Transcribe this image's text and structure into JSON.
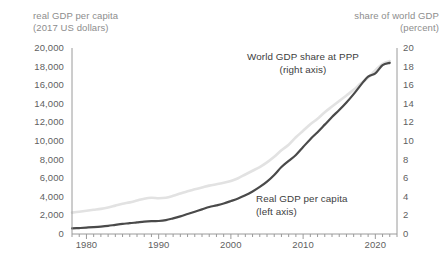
{
  "chart_data": {
    "type": "line",
    "title": "",
    "subtitle": "",
    "xlabel": "",
    "ylabel": "real GDP per capita (2017 US dollars)",
    "y2label": "share of world GDP (percent)",
    "grid": false,
    "legend_position": "inline-annotations",
    "xlim": [
      1978,
      2023
    ],
    "ylim": [
      0,
      20000
    ],
    "y2lim": [
      0,
      20
    ],
    "x_ticks": [
      1980,
      1990,
      2000,
      2010,
      2020
    ],
    "x_minor_tick_interval": 1,
    "y_left_ticks": [
      0,
      2000,
      4000,
      6000,
      8000,
      10000,
      12000,
      14000,
      16000,
      18000,
      20000
    ],
    "y_left_tick_labels": [
      "0",
      "2,000",
      "4,000",
      "6,000",
      "8,000",
      "10,000",
      "12,000",
      "14,000",
      "16,000",
      "18,000",
      "20,000"
    ],
    "y_right_ticks": [
      0,
      2,
      4,
      6,
      8,
      10,
      12,
      14,
      16,
      18,
      20
    ],
    "y_right_tick_labels": [
      "0",
      "2",
      "4",
      "6",
      "8",
      "10",
      "12",
      "14",
      "16",
      "18",
      "20"
    ],
    "series": [
      {
        "name": "Real GDP per capita",
        "axis": "left",
        "color": "#4a4a4a",
        "annotation": "Real GDP per capita\n(left axis)",
        "x": [
          1978,
          1979,
          1980,
          1981,
          1982,
          1983,
          1984,
          1985,
          1986,
          1987,
          1988,
          1989,
          1990,
          1991,
          1992,
          1993,
          1994,
          1995,
          1996,
          1997,
          1998,
          1999,
          2000,
          2001,
          2002,
          2003,
          2004,
          2005,
          2006,
          2007,
          2008,
          2009,
          2010,
          2011,
          2012,
          2013,
          2014,
          2015,
          2016,
          2017,
          2018,
          2019,
          2020,
          2021,
          2022
        ],
        "values": [
          600,
          640,
          690,
          740,
          800,
          880,
          990,
          1090,
          1160,
          1250,
          1340,
          1390,
          1400,
          1490,
          1680,
          1900,
          2150,
          2400,
          2650,
          2900,
          3080,
          3280,
          3540,
          3820,
          4160,
          4570,
          5060,
          5630,
          6350,
          7200,
          7860,
          8500,
          9350,
          10200,
          10950,
          11760,
          12580,
          13330,
          14140,
          15040,
          16030,
          16930,
          17270,
          18150,
          18400
        ]
      },
      {
        "name": "World GDP share at PPP",
        "axis": "right",
        "color": "#e2e2e2",
        "annotation": "World GDP share at PPP\n(right axis)",
        "x": [
          1978,
          1979,
          1980,
          1981,
          1982,
          1983,
          1984,
          1985,
          1986,
          1987,
          1988,
          1989,
          1990,
          1991,
          1992,
          1993,
          1994,
          1995,
          1996,
          1997,
          1998,
          1999,
          2000,
          2001,
          2002,
          2003,
          2004,
          2005,
          2006,
          2007,
          2008,
          2009,
          2010,
          2011,
          2012,
          2013,
          2014,
          2015,
          2016,
          2017,
          2018,
          2019,
          2020,
          2021,
          2022
        ],
        "values": [
          2.3,
          2.4,
          2.5,
          2.6,
          2.7,
          2.85,
          3.05,
          3.25,
          3.4,
          3.6,
          3.8,
          3.9,
          3.85,
          3.9,
          4.1,
          4.35,
          4.6,
          4.8,
          5.0,
          5.2,
          5.35,
          5.5,
          5.7,
          6.0,
          6.4,
          6.8,
          7.2,
          7.7,
          8.3,
          9.0,
          9.6,
          10.4,
          11.1,
          11.8,
          12.4,
          13.1,
          13.7,
          14.3,
          14.9,
          15.5,
          16.2,
          16.8,
          17.6,
          18.3,
          18.6
        ]
      }
    ]
  },
  "axes": {
    "left_title": "real GDP per capita\n(2017 US dollars)",
    "right_title": "share of world GDP\n(percent)"
  },
  "annotations": {
    "share_line_1": "World GDP share at PPP",
    "share_line_2": "(right axis)",
    "gdp_line_1": "Real GDP per capita",
    "gdp_line_2": "(left axis)"
  },
  "colors": {
    "dark_series": "#4a4a4a",
    "light_series": "#e3e3e3",
    "axis": "#9a9a9a",
    "tick_text": "#5f5f5f",
    "title_text": "#8d8d8d",
    "background": "#ffffff"
  }
}
